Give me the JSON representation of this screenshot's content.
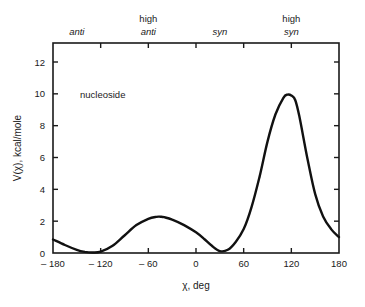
{
  "chart_data": {
    "type": "line",
    "title": "",
    "xlabel": "χ, deg",
    "ylabel": "V(χ), kcal/mole",
    "xlim": [
      -180,
      180
    ],
    "ylim": [
      0,
      13
    ],
    "grid": false,
    "legend": null,
    "x_ticks": [
      -180,
      -120,
      -60,
      0,
      60,
      120,
      180
    ],
    "x_tick_labels": [
      "– 180",
      "– 120",
      "– 60",
      "0",
      "60",
      "120",
      "180"
    ],
    "y_ticks": [
      0,
      2,
      4,
      6,
      8,
      10,
      12
    ],
    "y_tick_labels": [
      "0",
      "2",
      "4",
      "6",
      "8",
      "10",
      "12"
    ],
    "top_axis_regions": [
      {
        "line1": "",
        "line2": "anti",
        "x": -150
      },
      {
        "line1": "high",
        "line2": "anti",
        "x": -60
      },
      {
        "line1": "",
        "line2": "syn",
        "x": 30
      },
      {
        "line1": "high",
        "line2": "syn",
        "x": 120
      }
    ],
    "annotations": [
      {
        "text": "nucleoside",
        "x": -150,
        "y": 10
      }
    ],
    "series": [
      {
        "name": "nucleoside",
        "x": [
          -180,
          -165,
          -150,
          -140,
          -130,
          -120,
          -105,
          -90,
          -75,
          -60,
          -50,
          -45,
          -40,
          -30,
          -15,
          0,
          10,
          20,
          30,
          40,
          50,
          60,
          70,
          80,
          90,
          100,
          110,
          115,
          120,
          125,
          130,
          140,
          150,
          160,
          170,
          180
        ],
        "values": [
          0.85,
          0.5,
          0.2,
          0.07,
          0.03,
          0.08,
          0.45,
          1.1,
          1.75,
          2.15,
          2.27,
          2.28,
          2.25,
          2.1,
          1.75,
          1.3,
          0.9,
          0.45,
          0.12,
          0.2,
          0.7,
          1.5,
          2.9,
          4.8,
          7.0,
          8.7,
          9.75,
          9.95,
          9.9,
          9.6,
          8.6,
          6.0,
          3.7,
          2.3,
          1.5,
          1.0
        ]
      }
    ]
  }
}
